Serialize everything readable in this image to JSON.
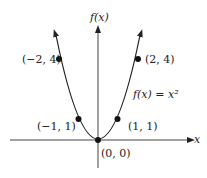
{
  "diagram": {
    "y_axis_label": "f(x)",
    "x_axis_label": "x",
    "curve_label": "f(x) = x²",
    "points": [
      {
        "label": "(−2, 4)",
        "x": -2,
        "y": 4
      },
      {
        "label": "(−1, 1)",
        "x": -1,
        "y": 1
      },
      {
        "label": "(0, 0)",
        "x": 0,
        "y": 0
      },
      {
        "label": "(1, 1)",
        "x": 1,
        "y": 1
      },
      {
        "label": "(2, 4)",
        "x": 2,
        "y": 4
      }
    ],
    "colors": {
      "stroke": "#222222",
      "background": "#ffffff"
    }
  }
}
